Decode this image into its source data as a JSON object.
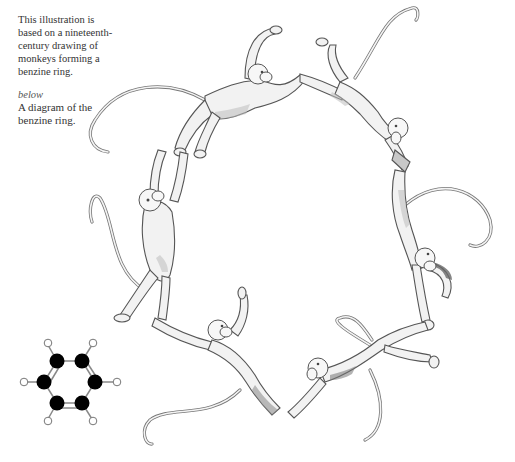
{
  "caption": {
    "main_text": "This illustration is based on a nineteenth-century drawing of monkeys forming a benzine ring.",
    "lines": [
      "This illustration is",
      "based on a nineteenth-",
      "century drawing of",
      "monkeys forming a",
      "benzine ring."
    ],
    "below_label": "below",
    "below_text_lines": [
      "A diagram of the",
      "benzine ring."
    ]
  },
  "illustration": {
    "subject": "six monkeys holding hands and feet forming a ring",
    "monkey_count": 6
  },
  "benzene_diagram": {
    "carbon_atoms": 6,
    "hydrogen_atoms": 6,
    "carbon_color": "#000000",
    "hydrogen_color": "#ffffff",
    "bond_color": "#888888"
  }
}
